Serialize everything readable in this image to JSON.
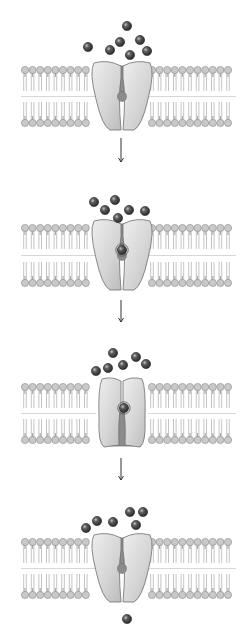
{
  "diagram": {
    "type": "sequence",
    "colors": {
      "background": "#ffffff",
      "lipid_head": "#c9c9c9",
      "lipid_head_stroke": "#8a8a8a",
      "lipid_tail": "#b5b5b5",
      "protein_fill": "#dcdcdc",
      "protein_stroke": "#6e6e6e",
      "channel_fill": "#8c8c8c",
      "particle": "#4a4a4a",
      "arrow": "#333333"
    },
    "panels": [
      {
        "step": 1,
        "label": "Particles outside; channel open to exterior",
        "membrane_top": 70,
        "membrane_bottom": 123,
        "protein_state": "open-outside",
        "particles": [
          [
            127,
            26
          ],
          [
            88,
            47
          ],
          [
            110,
            50
          ],
          [
            120,
            42
          ],
          [
            140,
            40
          ],
          [
            130,
            55
          ],
          [
            147,
            51
          ]
        ],
        "bound_particle": null
      },
      {
        "step": 2,
        "label": "Particle binds within channel",
        "membrane_top": 228,
        "membrane_bottom": 283,
        "protein_state": "open-outside",
        "particles": [
          [
            94,
            202
          ],
          [
            105,
            210
          ],
          [
            115,
            200
          ],
          [
            129,
            210
          ],
          [
            145,
            211
          ],
          [
            118,
            218
          ]
        ],
        "bound_particle": [
          122,
          250
        ]
      },
      {
        "step": 3,
        "label": "Channel changes shape, opening to interior",
        "membrane_top": 387,
        "membrane_bottom": 440,
        "protein_state": "open-inside",
        "particles": [
          [
            96,
            371
          ],
          [
            108,
            368
          ],
          [
            113,
            353
          ],
          [
            123,
            365
          ],
          [
            136,
            357
          ],
          [
            146,
            364
          ]
        ],
        "bound_particle": [
          124,
          408
        ]
      },
      {
        "step": 4,
        "label": "Particle released inside; channel returns to original shape",
        "membrane_top": 542,
        "membrane_bottom": 595,
        "protein_state": "open-outside",
        "particles": [
          [
            86,
            528
          ],
          [
            97,
            521
          ],
          [
            113,
            522
          ],
          [
            130,
            512
          ],
          [
            143,
            512
          ],
          [
            136,
            525
          ]
        ],
        "bound_particle": null,
        "released_particle": [
          127,
          619
        ]
      }
    ],
    "arrows": [
      {
        "from_step": 1,
        "to_step": 2,
        "x": 121,
        "y1": 138,
        "y2": 162
      },
      {
        "from_step": 2,
        "to_step": 3,
        "x": 121,
        "y1": 300,
        "y2": 322
      },
      {
        "from_step": 3,
        "to_step": 4,
        "x": 121,
        "y1": 458,
        "y2": 480
      }
    ]
  }
}
